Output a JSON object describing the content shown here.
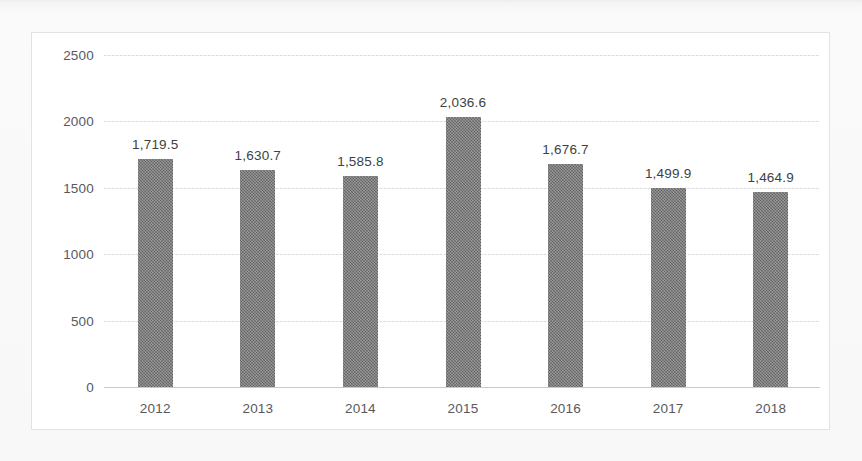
{
  "chart_data": {
    "type": "bar",
    "title": "",
    "subtitle": "",
    "xlabel": "",
    "ylabel": "",
    "categories": [
      "2012",
      "2013",
      "2014",
      "2015",
      "2016",
      "2017",
      "2018"
    ],
    "values": [
      1719.5,
      1630.7,
      1585.8,
      2036.6,
      1676.7,
      1499.9,
      1464.9
    ],
    "value_labels": [
      "1,719.5",
      "1,630.7",
      "1,585.8",
      "2,036.6",
      "1,676.7",
      "1,499.9",
      "1,464.9"
    ],
    "ylim": [
      0,
      2500
    ],
    "ytick_values": [
      0,
      500,
      1000,
      1500,
      2000,
      2500
    ],
    "ytick_labels": [
      "0",
      "500",
      "1000",
      "1500",
      "2000",
      "2500"
    ],
    "grid": true,
    "legend": null,
    "legend_position": "none",
    "series": [
      {
        "name": "",
        "values": [
          1719.5,
          1630.7,
          1585.8,
          2036.6,
          1676.7,
          1499.9,
          1464.9
        ]
      }
    ]
  },
  "style": {
    "bar_color": "#6e6e6e",
    "gridline_color": "#dcdcdf",
    "axis_line_color": "#c9c9cc",
    "tick_label_color": "#59595d",
    "value_label_color": "#3f3f42",
    "plot_background": "#ffffff",
    "page_background": "#f7f7f8",
    "frame_border_color": "#e2e2e4"
  }
}
